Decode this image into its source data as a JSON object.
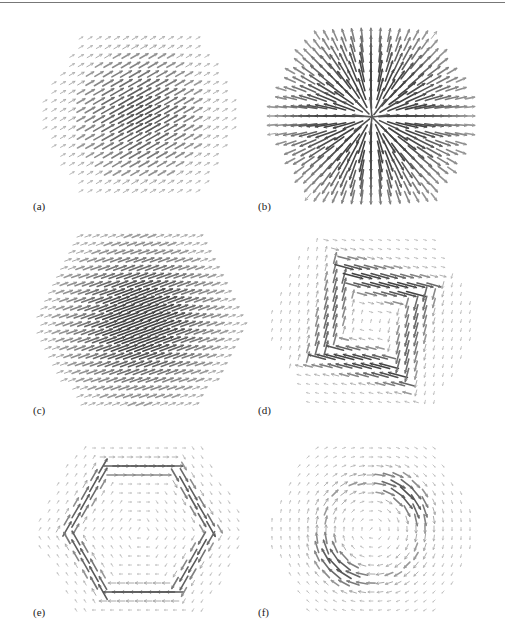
{
  "figure": {
    "panels": [
      {
        "id": "a",
        "label": "(a)",
        "type": "uniform",
        "angle": -30,
        "cx": 140,
        "cy": 115,
        "r": 95,
        "label_x": 33,
        "label_y": 200,
        "peak": 0.75,
        "sigma": 45
      },
      {
        "id": "b",
        "label": "(b)",
        "type": "radial",
        "cx": 372,
        "cy": 117,
        "r": 100,
        "label_x": 258,
        "label_y": 200,
        "peak": 0.85,
        "sigma": 60
      },
      {
        "id": "c",
        "label": "(c)",
        "type": "dense",
        "angle": -20,
        "cx": 140,
        "cy": 320,
        "r": 100,
        "label_x": 33,
        "label_y": 404,
        "peak": 0.9,
        "sigma": 45
      },
      {
        "id": "d",
        "label": "(d)",
        "type": "square-vortex",
        "cx": 372,
        "cy": 322,
        "r": 100,
        "label_x": 258,
        "label_y": 404,
        "peak": 0.85,
        "ring": 55
      },
      {
        "id": "e",
        "label": "(e)",
        "type": "hex-ring",
        "cx": 140,
        "cy": 530,
        "r": 100,
        "label_x": 33,
        "label_y": 606,
        "peak": 0.7,
        "ring": 62
      },
      {
        "id": "f",
        "label": "(f)",
        "type": "circular-vortex",
        "cx": 372,
        "cy": 530,
        "r": 100,
        "label_x": 258,
        "label_y": 606,
        "peak": 0.75,
        "ring": 50
      }
    ],
    "arrow_color": "#555555",
    "grid_step": 9
  }
}
